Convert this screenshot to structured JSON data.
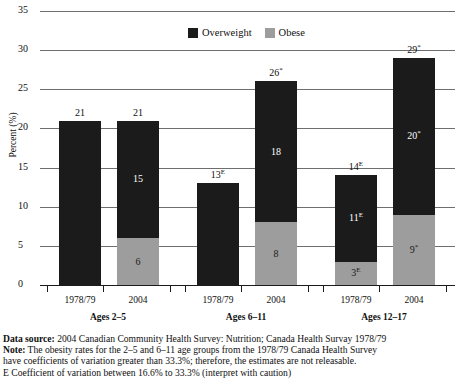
{
  "chart_data": {
    "type": "bar",
    "stacked": true,
    "title": "",
    "xlabel": "",
    "ylabel": "Percent (%)",
    "ylim": [
      0,
      35
    ],
    "ytick_values": [
      0,
      5,
      10,
      15,
      20,
      25,
      30,
      35
    ],
    "ytick_labels": [
      "0",
      "5",
      "10",
      "15",
      "20",
      "25",
      "30",
      "35"
    ],
    "grid": true,
    "legend_position": "top-center",
    "legend": [
      "Overweight",
      "Obese"
    ],
    "colors": {
      "overweight": "#1b1b1b",
      "obese": "#9d9d9d",
      "gridline": "#6e6e6e",
      "axis": "#1b1b1b",
      "text": "#101010"
    },
    "groups": [
      {
        "label": "Ages 2–5",
        "bars": [
          {
            "category": "1978/79",
            "total": 21,
            "total_label": "21",
            "total_sup": "",
            "segments": [
              {
                "name": "Overweight",
                "value": 21,
                "label": "",
                "sup": ""
              },
              {
                "name": "Obese",
                "value": 0,
                "label": "",
                "sup": ""
              }
            ]
          },
          {
            "category": "2004",
            "total": 21,
            "total_label": "21",
            "total_sup": "",
            "segments": [
              {
                "name": "Overweight",
                "value": 15,
                "label": "15",
                "sup": ""
              },
              {
                "name": "Obese",
                "value": 6,
                "label": "6",
                "sup": ""
              }
            ]
          }
        ]
      },
      {
        "label": "Ages 6–11",
        "bars": [
          {
            "category": "1978/79",
            "total": 13,
            "total_label": "13",
            "total_sup": "E",
            "segments": [
              {
                "name": "Overweight",
                "value": 13,
                "label": "",
                "sup": ""
              },
              {
                "name": "Obese",
                "value": 0,
                "label": "",
                "sup": ""
              }
            ]
          },
          {
            "category": "2004",
            "total": 26,
            "total_label": "26",
            "total_sup": "*",
            "segments": [
              {
                "name": "Overweight",
                "value": 18,
                "label": "18",
                "sup": ""
              },
              {
                "name": "Obese",
                "value": 8,
                "label": "8",
                "sup": ""
              }
            ]
          }
        ]
      },
      {
        "label": "Ages 12–17",
        "bars": [
          {
            "category": "1978/79",
            "total": 14,
            "total_label": "14",
            "total_sup": "E",
            "segments": [
              {
                "name": "Overweight",
                "value": 11,
                "label": "11",
                "sup": "E"
              },
              {
                "name": "Obese",
                "value": 3,
                "label": "3",
                "sup": "E"
              }
            ]
          },
          {
            "category": "2004",
            "total": 29,
            "total_label": "29",
            "total_sup": "*",
            "segments": [
              {
                "name": "Overweight",
                "value": 20,
                "label": "20",
                "sup": "*"
              },
              {
                "name": "Obese",
                "value": 9,
                "label": "9",
                "sup": "*"
              }
            ]
          }
        ]
      }
    ]
  },
  "legend": {
    "overweight_label": "Overweight",
    "obese_label": "Obese"
  },
  "axis": {
    "y_title": "Percent (%)"
  },
  "footnotes": {
    "data_source_bold": "Data source:",
    "data_source_text": " 2004 Canadian Community Health Survey: Nutrition; Canada Health Survay 1978/79",
    "note_bold": "Note:",
    "note_text": " The obesity rates for the 2–5 and 6–11 age groups from the 1978/79 Canada Health Survey",
    "note_line2": "have coefficients of variation greater  than 33.3%; therefore, the estimates are not releasable.",
    "e_note": "E Coefficient of variation between 16.6% to 33.3% (interpret with caution)"
  }
}
